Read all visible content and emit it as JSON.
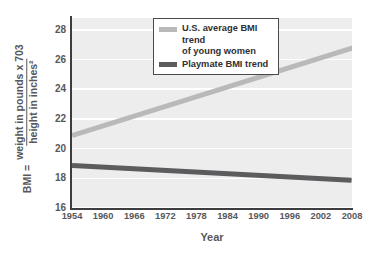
{
  "chart_data": {
    "type": "line",
    "title": "",
    "xlabel": "Year",
    "ylabel": "BMI",
    "ylabel_parts": {
      "lhs": "BMI =",
      "numerator": "weight in pounds x 703",
      "denominator": "height in inches²"
    },
    "xlim": [
      1954,
      2008
    ],
    "ylim": [
      16,
      28.8
    ],
    "x_ticks": [
      1954,
      1960,
      1966,
      1972,
      1978,
      1984,
      1990,
      1996,
      2002,
      2008
    ],
    "x_tick_labels": [
      "1954",
      "1960",
      "1966",
      "1972",
      "1978",
      "1984",
      "1990",
      "1996",
      "2002",
      "2008"
    ],
    "y_ticks": [
      16,
      18,
      20,
      22,
      24,
      26,
      28
    ],
    "y_tick_labels": [
      "16",
      "18",
      "20",
      "22",
      "24",
      "26",
      "28"
    ],
    "grid": "horizontal-white",
    "plot_background": "#ededed",
    "legend_position": "top-center",
    "series": [
      {
        "name": "U.S. average BMI trend of young women",
        "color": "#b9b9b9",
        "x": [
          1954,
          2010
        ],
        "values": [
          20.9,
          27.0
        ]
      },
      {
        "name": "Playmate BMI trend",
        "color": "#5c5c5e",
        "x": [
          1954,
          2008
        ],
        "values": [
          18.9,
          17.9
        ]
      }
    ]
  },
  "legend": {
    "entries": [
      {
        "label_line1": "U.S. average BMI trend",
        "label_line2": "of young women",
        "color": "#b9b9b9"
      },
      {
        "label_line1": "Playmate BMI trend",
        "label_line2": "",
        "color": "#5c5c5e"
      }
    ]
  },
  "axes": {
    "x_title": "Year",
    "y_title_lhs": "BMI =",
    "y_title_numerator": "weight in pounds x 703",
    "y_title_denominator": "height in inches²"
  }
}
